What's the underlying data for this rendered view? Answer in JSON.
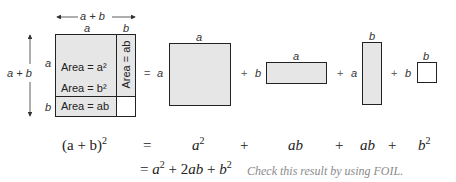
{
  "diagram": {
    "fill_color": "#e6e6e6",
    "stroke_color": "#222222",
    "big_square": {
      "top_dimension": "a + b",
      "left_dimension": "a + b",
      "top_labels": [
        "a",
        "b"
      ],
      "side_labels": [
        "a",
        "b"
      ],
      "regions": {
        "a_squared": "Area = a²",
        "b_squared": "Area = b²",
        "ab_bottom": "Area = ab",
        "ab_right": "Area = ab"
      }
    },
    "decomposition": {
      "equals": "=",
      "pieces": [
        {
          "name": "a-squared",
          "side_label": "a",
          "top_label": "a",
          "shaded": true
        },
        {
          "name": "ab-horizontal",
          "side_label": "b",
          "top_label": "a",
          "shaded": true
        },
        {
          "name": "ab-vertical",
          "side_label": "a",
          "top_label": "b",
          "shaded": true
        },
        {
          "name": "b-squared",
          "side_label": "b",
          "top_label": "b",
          "shaded": false
        }
      ],
      "plus": "+"
    },
    "equation_row1": {
      "lhs_base": "(a + b)",
      "lhs_exp": "2",
      "equals": "=",
      "term1_base": "a",
      "term1_exp": "2",
      "plus1": "+",
      "term2": "ab",
      "plus2": "+",
      "term3": "ab",
      "plus3": "+",
      "term4_base": "b",
      "term4_exp": "2"
    },
    "equation_row2": {
      "equals": "=",
      "a": "a",
      "a_exp": "2",
      "plus1": "+",
      "mid": "2ab",
      "plus2": "+",
      "b": "b",
      "b_exp": "2",
      "note": "Check this result by using FOIL."
    }
  }
}
